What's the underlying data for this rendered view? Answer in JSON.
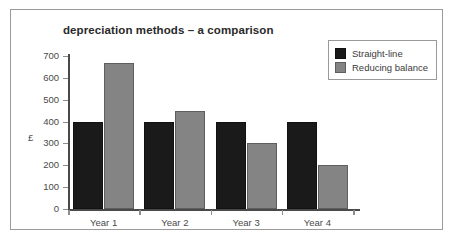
{
  "chart_data": {
    "type": "bar",
    "title": "depreciation methods – a comparison",
    "xlabel": "",
    "ylabel": "£",
    "categories": [
      "Year 1",
      "Year 2",
      "Year 3",
      "Year 4"
    ],
    "series": [
      {
        "name": "Straight-line",
        "color": "#1a1a1a",
        "values": [
          400,
          400,
          400,
          400
        ]
      },
      {
        "name": "Reducing balance",
        "color": "#848484",
        "values": [
          670,
          450,
          300,
          200
        ]
      }
    ],
    "ylim": [
      0,
      700
    ],
    "y_ticks": [
      0,
      100,
      200,
      300,
      400,
      500,
      600,
      700
    ],
    "y_tick_labels": [
      "0",
      "100",
      "200",
      "300",
      "400",
      "500",
      "600",
      "700"
    ],
    "grid": false,
    "legend_position": "top-right"
  },
  "frame": {
    "border_color": "#9a9a9a",
    "background": "#ffffff"
  }
}
